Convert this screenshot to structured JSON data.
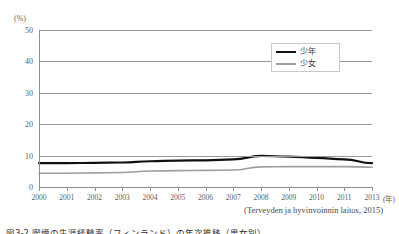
{
  "figure": {
    "y_unit_label": "(%)",
    "x_unit_label": "(年)",
    "source_note": "(Terveyden ja hyvinvoinnin laitos, 2015)",
    "caption": "図3-2 喫煙の生涯経験率（フィンランド）の年次推移（男女別）"
  },
  "legend": {
    "position": "top-right-inside",
    "items": [
      {
        "label": "少年",
        "color": "#111111",
        "style": "thick-solid"
      },
      {
        "label": "少女",
        "color": "#9e9e9e",
        "style": "thin-solid"
      }
    ]
  },
  "chart_data": {
    "type": "line",
    "title": "",
    "subtitle": "",
    "xlabel": "年",
    "ylabel": "%",
    "ylim": [
      0,
      50
    ],
    "yticks": [
      0,
      10,
      20,
      30,
      40,
      50
    ],
    "ytick_labels": [
      "0",
      "10",
      "20",
      "30",
      "40",
      "50"
    ],
    "grid": true,
    "grid_axis": "y",
    "categories": [
      "2000",
      "2001",
      "2002",
      "2003",
      "2004",
      "2005",
      "2006",
      "2007",
      "2008",
      "2009",
      "2010",
      "2011",
      "2013"
    ],
    "xtick_labels": [
      "2000",
      "2001",
      "2002",
      "2003",
      "2004",
      "2005",
      "2006",
      "2007",
      "2008",
      "2009",
      "2010",
      "2011",
      "2013"
    ],
    "legend_position": "upper right",
    "series": [
      {
        "name": "少年",
        "color": "#111111",
        "linewidth": 2.2,
        "values": [
          7.6,
          7.6,
          7.7,
          7.8,
          8.2,
          8.4,
          8.5,
          8.8,
          9.9,
          9.7,
          9.3,
          8.8,
          7.6
        ]
      },
      {
        "name": "少女",
        "color": "#9e9e9e",
        "linewidth": 1.6,
        "values": [
          4.4,
          4.4,
          4.5,
          4.6,
          5.1,
          5.2,
          5.3,
          5.4,
          6.4,
          6.5,
          6.5,
          6.5,
          6.3
        ]
      }
    ]
  }
}
